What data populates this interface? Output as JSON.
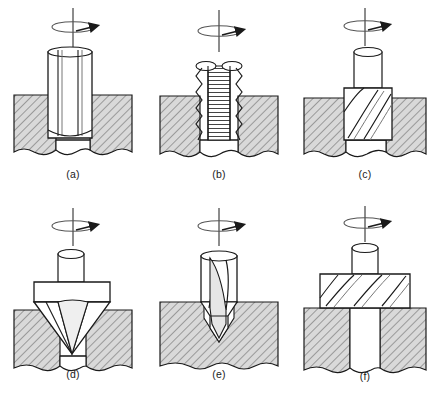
{
  "figure": {
    "rows": 2,
    "cols": 3,
    "background": "#ffffff",
    "line_color": "#1a1a1a",
    "hatch_fill": "#d8d8d8",
    "hatch_line": "#555555",
    "tool_fill": "#ffffff",
    "shade_fill": "#e8e8e8"
  },
  "panels": [
    {
      "id": "a",
      "caption": "(a)",
      "operation": "reaming",
      "tool_name": "reamer",
      "flute_type": "straight",
      "workpiece": "sectioned-block",
      "hole": "through-hole",
      "rotation_symbol": "clockwise-rotation-arrow",
      "rotation_label": "rotation-axis"
    },
    {
      "id": "b",
      "caption": "(b)",
      "operation": "tapping",
      "tool_name": "tap",
      "flute_type": "threaded",
      "workpiece": "sectioned-block",
      "hole": "threaded-hole",
      "rotation_symbol": "clockwise-rotation-arrow",
      "rotation_label": "rotation-axis"
    },
    {
      "id": "c",
      "caption": "(c)",
      "operation": "counterboring",
      "tool_name": "counterbore",
      "flute_type": "helical",
      "workpiece": "sectioned-block",
      "hole": "stepped-hole",
      "rotation_symbol": "clockwise-rotation-arrow",
      "rotation_label": "rotation-axis"
    },
    {
      "id": "d",
      "caption": "(d)",
      "operation": "countersinking",
      "tool_name": "countersink",
      "flute_type": "conical",
      "workpiece": "sectioned-block",
      "hole": "countersunk-hole",
      "rotation_symbol": "clockwise-rotation-arrow",
      "rotation_label": "rotation-axis"
    },
    {
      "id": "e",
      "caption": "(e)",
      "operation": "center-drilling",
      "tool_name": "center-drill",
      "flute_type": "pointed",
      "workpiece": "sectioned-block",
      "hole": "center-hole",
      "rotation_symbol": "clockwise-rotation-arrow",
      "rotation_label": "rotation-axis"
    },
    {
      "id": "f",
      "caption": "(f)",
      "operation": "spot-facing",
      "tool_name": "spot-facer",
      "flute_type": "helical",
      "workpiece": "sectioned-block",
      "hole": "spot-faced-hole",
      "rotation_symbol": "clockwise-rotation-arrow",
      "rotation_label": "rotation-axis"
    }
  ]
}
